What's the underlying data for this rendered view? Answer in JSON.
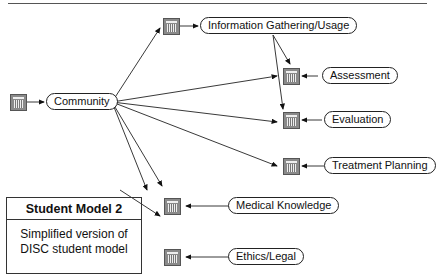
{
  "figure": {
    "caption_cut": "Figure"
  },
  "nodes": {
    "community": "Community",
    "info": "Information Gathering/Usage",
    "assessment": "Assessment",
    "evaluation": "Evaluation",
    "treatment": "Treatment Planning",
    "medical": "Medical Knowledge",
    "ethics": "Ethics/Legal"
  },
  "legend": {
    "title": "Student Model 2",
    "line1": "Simplified version of",
    "line2": "DISC student model"
  },
  "colors": {
    "node_icon": "#8a8a8a",
    "stroke": "#222222"
  }
}
